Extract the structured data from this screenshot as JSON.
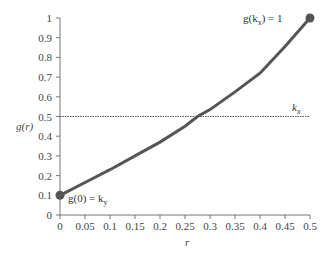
{
  "chart_data": {
    "type": "line",
    "title": "",
    "xlabel": "r",
    "ylabel": "g(r)",
    "xlim": [
      0,
      0.5
    ],
    "ylim": [
      0,
      1
    ],
    "grid": false,
    "x_ticks": [
      "0",
      "0.05",
      "0.1",
      "0.15",
      "0.2",
      "0.25",
      "0.3",
      "0.35",
      "0.4",
      "0.45",
      "0.5"
    ],
    "y_ticks": [
      "0",
      "0.1",
      "0.2",
      "0.3",
      "0.4",
      "0.5",
      "0.6",
      "0.7",
      "0.8",
      "0.9",
      "1"
    ],
    "series": [
      {
        "name": "g(r)",
        "x": [
          0,
          0.05,
          0.1,
          0.15,
          0.2,
          0.25,
          0.275,
          0.3,
          0.35,
          0.4,
          0.45,
          0.5
        ],
        "y": [
          0.1,
          0.165,
          0.23,
          0.3,
          0.37,
          0.45,
          0.5,
          0.535,
          0.625,
          0.72,
          0.855,
          1.0
        ],
        "color": "#555555"
      },
      {
        "name": "k_x",
        "type": "hline",
        "y": 0.5,
        "style": "dotted",
        "color": "#555555"
      }
    ],
    "points": [
      {
        "x": 0,
        "y": 0.1,
        "label": "g(0) = k_y"
      },
      {
        "x": 0.5,
        "y": 1.0,
        "label": "g(k_x) = 1"
      }
    ],
    "annotations": [
      {
        "text": "k_x",
        "x": 0.47,
        "y": 0.53
      },
      {
        "text": "g(0) = k_y",
        "x": 0.01,
        "y": 0.08
      },
      {
        "text": "g(k_x) = 1",
        "x": 0.37,
        "y": 0.98
      }
    ]
  },
  "labels": {
    "ylabel": "g(r)",
    "xlabel": "r",
    "kx": "k",
    "kx_sub": "x",
    "start_pre": "g(0) = k",
    "start_sub": "y",
    "end_pre": "g(k",
    "end_sub": "x",
    "end_post": ") = 1"
  }
}
